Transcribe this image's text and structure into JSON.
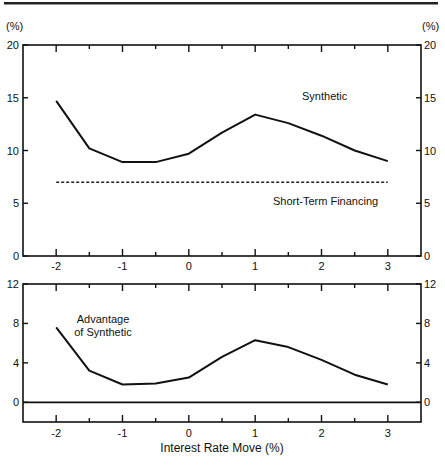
{
  "chart_data": [
    {
      "type": "line",
      "panel": "top",
      "title": "",
      "xlabel": "",
      "ylabel": "(%)",
      "ylabel_right": "(%)",
      "x": [
        -2,
        -1.5,
        -1,
        -0.5,
        0,
        0.5,
        1,
        1.5,
        2,
        2.5,
        3
      ],
      "xlim": [
        -2.5,
        3.5
      ],
      "ylim": [
        0,
        20
      ],
      "xticks": [
        "-2",
        "-1",
        "0",
        "1",
        "2",
        "3"
      ],
      "yticks": [
        "0",
        "5",
        "10",
        "15",
        "20"
      ],
      "grid": false,
      "series": [
        {
          "name": "Synthetic",
          "style": "solid",
          "values": [
            14.7,
            10.2,
            8.9,
            8.9,
            9.7,
            11.7,
            13.4,
            12.6,
            11.4,
            10.0,
            9.0
          ]
        },
        {
          "name": "Short-Term Financing",
          "style": "dashed",
          "values": [
            7.0,
            7.0,
            7.0,
            7.0,
            7.0,
            7.0,
            7.0,
            7.0,
            7.0,
            7.0,
            7.0
          ]
        }
      ],
      "annotations": [
        "Synthetic",
        "Short-Term Financing"
      ]
    },
    {
      "type": "line",
      "panel": "bottom",
      "title": "",
      "xlabel": "Interest Rate Move (%)",
      "ylabel": "",
      "x": [
        -2,
        -1.5,
        -1,
        -0.5,
        0,
        0.5,
        1,
        1.5,
        2,
        2.5,
        3
      ],
      "xlim": [
        -2.5,
        3.5
      ],
      "ylim": [
        -2,
        12
      ],
      "xticks": [
        "-2",
        "-1",
        "0",
        "1",
        "2",
        "3"
      ],
      "yticks": [
        "0",
        "4",
        "8",
        "12"
      ],
      "grid": false,
      "series": [
        {
          "name": "Advantage of Synthetic",
          "style": "solid",
          "values": [
            7.6,
            3.2,
            1.8,
            1.9,
            2.5,
            4.6,
            6.3,
            5.6,
            4.3,
            2.8,
            1.8
          ]
        },
        {
          "name": "Zero line",
          "style": "solid",
          "values": [
            0,
            0,
            0,
            0,
            0,
            0,
            0,
            0,
            0,
            0,
            0
          ]
        }
      ],
      "annotations": [
        "Advantage",
        "of Synthetic"
      ]
    }
  ],
  "labels": {
    "top_unit_left": "(%)",
    "top_unit_right": "(%)",
    "synthetic": "Synthetic",
    "short_term": "Short-Term Financing",
    "advantage_line1": "Advantage",
    "advantage_line2": "of Synthetic",
    "x_axis_title": "Interest Rate Move (%)"
  }
}
